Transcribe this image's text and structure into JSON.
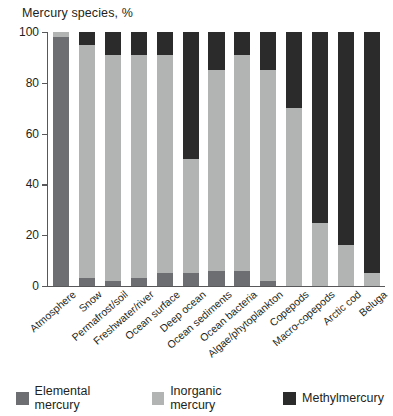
{
  "chart_data": {
    "type": "bar",
    "title": "Mercury species, %",
    "xlabel": "",
    "ylabel": "",
    "ylim": [
      0,
      100
    ],
    "yticks": [
      0,
      20,
      40,
      60,
      80,
      100
    ],
    "grid": false,
    "stacked": true,
    "stack_mode": "percent",
    "legend_position": "bottom",
    "orientation": "vertical",
    "categories": [
      "Atmosphere",
      "Snow",
      "Permafrost/soil",
      "Freshwater/river",
      "Ocean surface",
      "Deep ocean",
      "Ocean sediments",
      "Ocean bacteria",
      "Algae/phytoplankton",
      "Copepods",
      "Macro-copepods",
      "Arctic cod",
      "Beluga"
    ],
    "series": [
      {
        "name": "Elemental mercury",
        "color": "#6d6e71",
        "values": [
          98,
          3,
          2,
          3,
          5,
          5,
          6,
          6,
          2,
          0,
          0,
          0,
          0
        ]
      },
      {
        "name": "Inorganic mercury",
        "color": "#b2b3b3",
        "values": [
          2,
          92,
          89,
          88,
          86,
          45,
          79,
          85,
          83,
          70,
          25,
          16,
          5
        ]
      },
      {
        "name": "Methylmercury",
        "color": "#2b2b2b",
        "values": [
          0,
          5,
          9,
          9,
          9,
          50,
          15,
          9,
          15,
          30,
          75,
          84,
          95
        ]
      }
    ]
  },
  "legend": {
    "items": [
      {
        "label": "Elemental mercury",
        "color": "#6d6e71"
      },
      {
        "label": "Inorganic mercury",
        "color": "#b2b3b3"
      },
      {
        "label": "Methylmercury",
        "color": "#2b2b2b"
      }
    ]
  }
}
